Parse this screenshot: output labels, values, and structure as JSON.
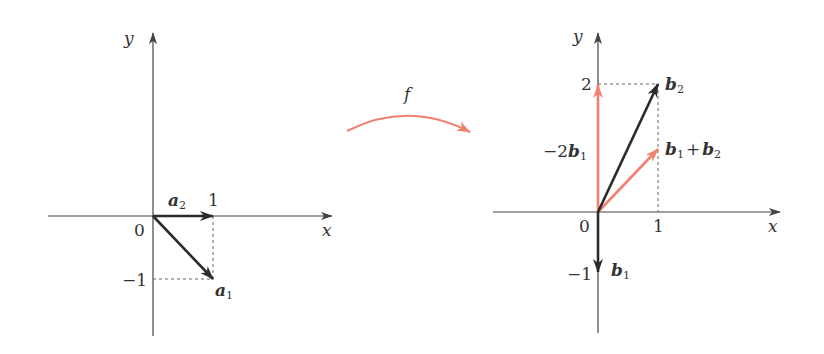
{
  "colors": {
    "axis": "#444444",
    "dark_vector": "#2b2b2b",
    "accent_vector": "#f08070",
    "dashed": "#666666",
    "text": "#333333"
  },
  "map_arrow": {
    "label": "f"
  },
  "left_plot": {
    "axis_x_label": "x",
    "axis_y_label": "y",
    "origin_label": "0",
    "tick_x_1": "1",
    "tick_y_neg1": "−1",
    "vectors": [
      {
        "name": "a",
        "sub": "2",
        "coords": [
          1,
          0
        ],
        "color": "dark"
      },
      {
        "name": "a",
        "sub": "1",
        "coords": [
          1,
          -1
        ],
        "color": "dark"
      }
    ]
  },
  "right_plot": {
    "axis_x_label": "x",
    "axis_y_label": "y",
    "origin_label": "0",
    "tick_x_1": "1",
    "tick_y_2": "2",
    "tick_y_neg1": "−1",
    "vectors": [
      {
        "name": "b",
        "sub": "2",
        "coords": [
          1,
          2
        ],
        "color": "dark"
      },
      {
        "name": "b",
        "sub": "1",
        "coords": [
          0,
          -1
        ],
        "color": "dark"
      },
      {
        "label_prefix": "−2",
        "name": "b",
        "sub": "1",
        "coords": [
          0,
          2
        ],
        "color": "accent"
      },
      {
        "name": "b",
        "sub": "1",
        "plus": "+",
        "name2": "b",
        "sub2": "2",
        "coords": [
          1,
          1
        ],
        "color": "accent"
      }
    ]
  }
}
